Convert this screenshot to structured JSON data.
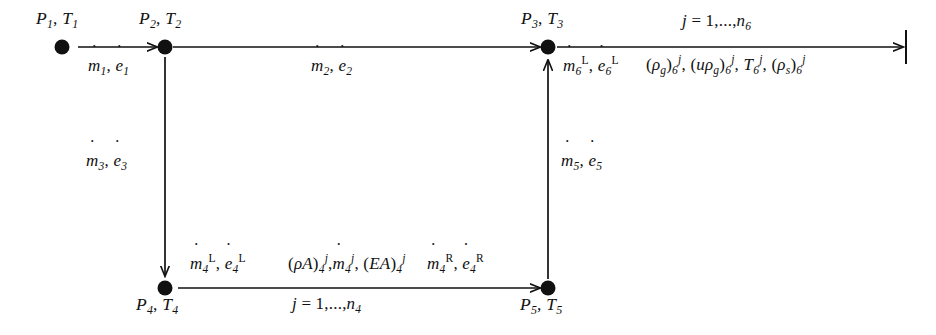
{
  "figure": {
    "type": "flow-network-diagram",
    "background": "#ffffff",
    "stroke_color": "#111111"
  },
  "nodes": [
    {
      "id": "n1",
      "label_P": "P",
      "label_sub": "1",
      "label_T": "T",
      "label": "P1, T1",
      "x": 62,
      "y": 47,
      "label_x": 36,
      "label_y": 10
    },
    {
      "id": "n2",
      "label_P": "P",
      "label_sub": "2",
      "label_T": "T",
      "label": "P2, T2",
      "x": 165,
      "y": 47,
      "label_x": 139,
      "label_y": 10
    },
    {
      "id": "n3",
      "label_P": "P",
      "label_sub": "3",
      "label_T": "T",
      "label": "P3, T3",
      "x": 548,
      "y": 47,
      "label_x": 520,
      "label_y": 10
    },
    {
      "id": "n4",
      "label_P": "P",
      "label_sub": "4",
      "label_T": "T",
      "label": "P4, T4",
      "x": 165,
      "y": 288,
      "label_x": 136,
      "label_y": 296
    },
    {
      "id": "n5",
      "label_P": "P",
      "label_sub": "5",
      "label_T": "T",
      "label": "P5, T5",
      "x": 548,
      "y": 288,
      "label_x": 520,
      "label_y": 296
    }
  ],
  "edges": [
    {
      "id": "e1",
      "from": "n1",
      "to": "n2",
      "orientation": "horizontal",
      "direction": "right",
      "x1": 76,
      "y1": 47,
      "x2": 158,
      "y2": 47
    },
    {
      "id": "e2",
      "from": "n2",
      "to": "n3",
      "orientation": "horizontal",
      "direction": "right",
      "x1": 172,
      "y1": 47,
      "x2": 541,
      "y2": 47
    },
    {
      "id": "e6",
      "from": "n3",
      "to": "outlet",
      "orientation": "horizontal",
      "direction": "right-terminated",
      "x1": 556,
      "y1": 47,
      "x2": 906,
      "y2": 47
    },
    {
      "id": "e3",
      "from": "n2",
      "to": "n4",
      "orientation": "vertical",
      "direction": "down",
      "x1": 165,
      "y1": 56,
      "x2": 165,
      "y2": 279
    },
    {
      "id": "e5",
      "from": "n5",
      "to": "n3",
      "orientation": "vertical",
      "direction": "up",
      "x1": 548,
      "y1": 279,
      "x2": 548,
      "y2": 57
    },
    {
      "id": "e4",
      "from": "n4",
      "to": "n5",
      "orientation": "horizontal",
      "direction": "right",
      "x1": 176,
      "y1": 288,
      "x2": 541,
      "y2": 288
    }
  ],
  "labels": {
    "flow1": {
      "m": "m",
      "m_sub": "1",
      "e": "e",
      "e_sub": "1",
      "text": "ṁ1, ė1",
      "x": 88,
      "y": 57
    },
    "flow2": {
      "m": "m",
      "m_sub": "2",
      "e": "e",
      "e_sub": "2",
      "text": "ṁ2, ė2",
      "x": 311,
      "y": 57
    },
    "flow3": {
      "m": "m",
      "m_sub": "3",
      "e": "e",
      "e_sub": "3",
      "text": "ṁ3, ė3",
      "x": 86,
      "y": 152
    },
    "flow5": {
      "m": "m",
      "m_sub": "5",
      "e": "e",
      "e_sub": "5",
      "text": "ṁ5, ė5",
      "x": 561,
      "y": 152
    },
    "flow6L": {
      "text": "ṁ6L, ė6L",
      "x": 563,
      "y": 57
    },
    "flow4L": {
      "text": "ṁ4L, ė4L",
      "x": 190,
      "y": 255
    },
    "flow4R": {
      "text": "ṁ4R, ė4R",
      "x": 427,
      "y": 255
    },
    "field6": {
      "text": "(ρg)6j, (uρg)6j, T6j, (ρs)6j",
      "x": 646,
      "y": 57
    },
    "field4": {
      "text": "(ρA)4j, ṁ4j, (EA)4j",
      "x": 285,
      "y": 255
    },
    "range6": {
      "text": "j = 1,...,n6",
      "x": 682,
      "y": 13
    },
    "range4": {
      "text": "j = 1,...,n4",
      "x": 290,
      "y": 296
    }
  },
  "symbols": {
    "rho": "ρ",
    "overdot": "˙",
    "ellipsis": "...",
    "equals": "=",
    "comma": ","
  },
  "legend_semantics": {
    "m_dot": "mass flow rate",
    "e_dot": "energy flow rate",
    "P": "pressure",
    "T": "temperature",
    "rho_g": "gas density",
    "u_rho_g": "gas momentum density",
    "rho_s": "solid density",
    "rho_A": "density times area",
    "EA": "energy times area",
    "superscript_L": "left",
    "superscript_R": "right",
    "superscript_j": "cell index"
  }
}
